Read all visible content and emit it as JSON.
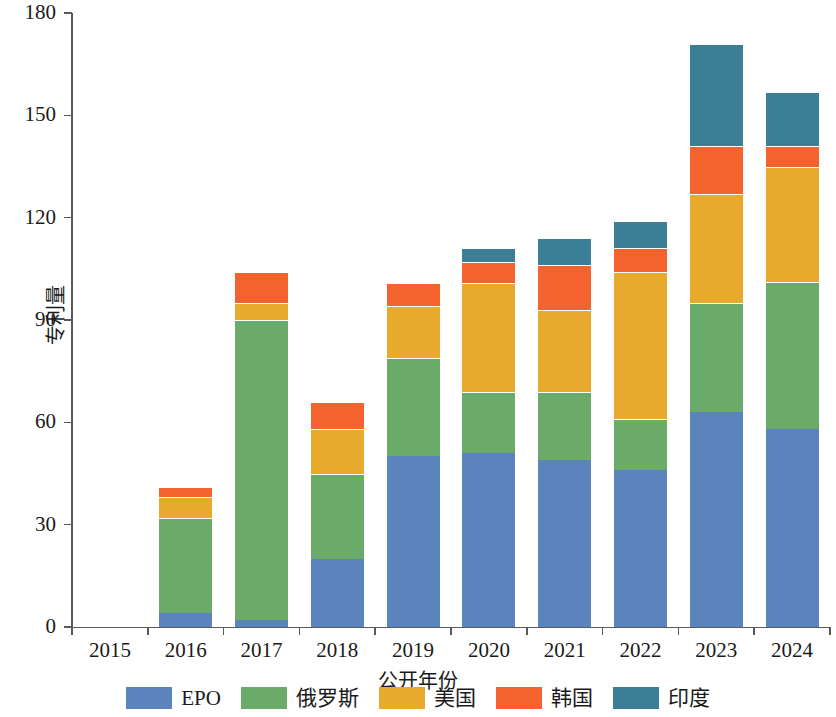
{
  "chart_data": {
    "type": "bar",
    "stacked": true,
    "title": "",
    "xlabel": "公开年份",
    "ylabel": "专利量",
    "categories": [
      "2015",
      "2016",
      "2017",
      "2018",
      "2019",
      "2020",
      "2021",
      "2022",
      "2023",
      "2024"
    ],
    "ylim": [
      0,
      180
    ],
    "yticks": [
      0,
      30,
      60,
      90,
      120,
      150,
      180
    ],
    "grid": false,
    "legend_position": "bottom",
    "series": [
      {
        "name": "EPO",
        "color": "#5b84bd",
        "values": [
          0,
          4,
          2,
          20,
          50,
          51,
          49,
          46,
          63,
          58
        ]
      },
      {
        "name": "俄罗斯",
        "color": "#6aab6a",
        "values": [
          0,
          28,
          88,
          25,
          29,
          18,
          20,
          15,
          32,
          43
        ]
      },
      {
        "name": "美国",
        "color": "#e8aa2c",
        "values": [
          0,
          6,
          5,
          13,
          15,
          32,
          24,
          43,
          32,
          34
        ]
      },
      {
        "name": "韩国",
        "color": "#f4622d",
        "values": [
          0,
          3,
          9,
          8,
          7,
          6,
          13,
          7,
          14,
          6
        ]
      },
      {
        "name": "印度",
        "color": "#3b7f96",
        "values": [
          0,
          0,
          0,
          0,
          0,
          4,
          8,
          8,
          30,
          16
        ]
      }
    ],
    "totals": [
      0,
      41,
      104,
      66,
      101,
      111,
      114,
      119,
      171,
      157
    ]
  }
}
